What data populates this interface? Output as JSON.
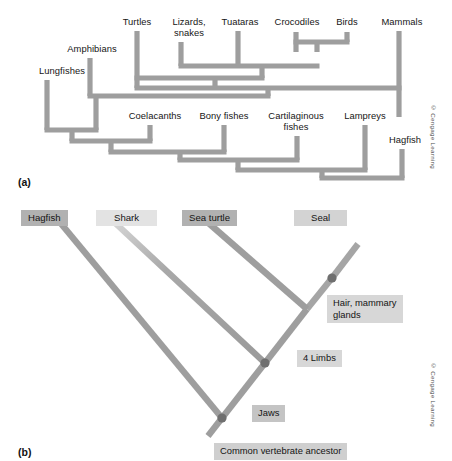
{
  "figure": {
    "panel_a": {
      "tag": "(a)",
      "type": "rectangular-cladogram",
      "copyright": "© Cengage Learning",
      "taxa": [
        {
          "name": "Lungfishes",
          "x": 62,
          "y": 70,
          "tip_x": 47,
          "tip_y": 80
        },
        {
          "name": "Amphibians",
          "x": 92,
          "y": 48,
          "tip_x": 90,
          "tip_y": 58
        },
        {
          "name": "Turtles",
          "x": 137,
          "y": 21,
          "tip_x": 137,
          "tip_y": 31
        },
        {
          "name": "Lizards,\nsnakes",
          "x": 189,
          "y": 21,
          "tip_x": 181,
          "tip_y": 42
        },
        {
          "name": "Tuataras",
          "x": 240,
          "y": 21,
          "tip_x": 238,
          "tip_y": 31
        },
        {
          "name": "Crocodiles",
          "x": 297,
          "y": 21,
          "tip_x": 296,
          "tip_y": 32
        },
        {
          "name": "Birds",
          "x": 347,
          "y": 21,
          "tip_x": 347,
          "tip_y": 32
        },
        {
          "name": "Mammals",
          "x": 402,
          "y": 21,
          "tip_x": 399,
          "tip_y": 31
        },
        {
          "name": "Coelacanths",
          "x": 155,
          "y": 115,
          "tip_x": 150,
          "tip_y": 125
        },
        {
          "name": "Bony fishes",
          "x": 224,
          "y": 115,
          "tip_x": 224,
          "tip_y": 125
        },
        {
          "name": "Cartilaginous\nfishes",
          "x": 296,
          "y": 115,
          "tip_x": 297,
          "tip_y": 136
        },
        {
          "name": "Lampreys",
          "x": 365,
          "y": 115,
          "tip_x": 365,
          "tip_y": 125
        },
        {
          "name": "Hagfish",
          "x": 405,
          "y": 139,
          "tip_x": 402,
          "tip_y": 149
        }
      ]
    },
    "panel_b": {
      "tag": "(b)",
      "type": "diagonal-cladogram",
      "copyright": "© Cengage Learning",
      "taxa": [
        {
          "name": "Hagfish",
          "box_shade": "#adadad"
        },
        {
          "name": "Shark",
          "box_shade": "#e2e2e2"
        },
        {
          "name": "Sea turtle",
          "box_shade": "#adadad"
        },
        {
          "name": "Seal",
          "box_shade": "#d2d2d2"
        }
      ],
      "traits": [
        {
          "name": "Hair, mammary\nglands"
        },
        {
          "name": "4 Limbs"
        },
        {
          "name": "Jaws"
        },
        {
          "name": "Common vertebrate ancestor"
        }
      ],
      "node_count": 3
    },
    "colors": {
      "branch": "#9e9e9e",
      "branch_dark": "#8f8f8f",
      "node_dot": "#6f6f6f",
      "box_gray": "#c0c0c0",
      "box_light": "#dcdcdc",
      "text": "#141414",
      "background": "#ffffff"
    }
  }
}
